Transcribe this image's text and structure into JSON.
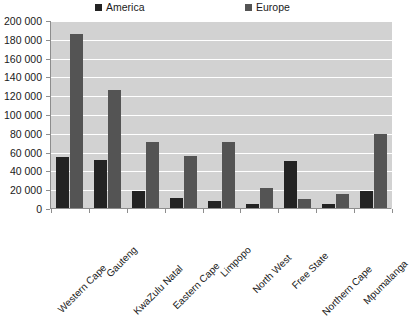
{
  "chart_data": {
    "type": "bar",
    "title": "",
    "subtitle": "",
    "xlabel": "",
    "ylabel": "",
    "ylim": [
      0,
      200000
    ],
    "ytick_values": [
      0,
      20000,
      40000,
      60000,
      80000,
      100000,
      120000,
      140000,
      160000,
      180000,
      200000
    ],
    "ytick_labels": [
      "0",
      "20 000",
      "40 000",
      "60 000",
      "80 000",
      "100 000",
      "120 000",
      "140 000",
      "160 000",
      "180 000",
      "200 000"
    ],
    "grid": true,
    "legend_position": "top",
    "categories": [
      "Western Cape",
      "Gauteng",
      "KwaZulu Natal",
      "Eastern Cape",
      "Limpopo",
      "North West",
      "Free State",
      "Northern Cape",
      "Mpumalanga"
    ],
    "series": [
      {
        "name": "America",
        "color": "#232323",
        "values": [
          54000,
          51000,
          18500,
          10500,
          7000,
          4500,
          49500,
          4500,
          18500
        ]
      },
      {
        "name": "Europe",
        "color": "#545454",
        "values": [
          185000,
          126000,
          70500,
          55000,
          70500,
          21000,
          10000,
          14500,
          79000
        ]
      }
    ],
    "plot_background": "#d2d2d2",
    "gridline_color": "#ffffff",
    "axis_color": "#8d8d8d"
  }
}
